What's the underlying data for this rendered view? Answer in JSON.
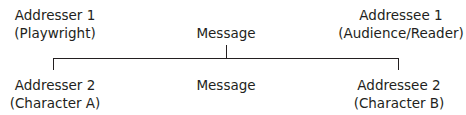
{
  "diagram": {
    "top": {
      "addresser": {
        "line1": "Addresser 1",
        "line2": "(Playwright)"
      },
      "message": "Message",
      "addressee": {
        "line1": "Addressee 1",
        "line2": "(Audience/Reader)"
      }
    },
    "bottom": {
      "addresser": {
        "line1": "Addresser 2",
        "line2": "(Character A)"
      },
      "message": "Message",
      "addressee": {
        "line1": "Addressee 2",
        "line2": "(Character B)"
      }
    }
  }
}
